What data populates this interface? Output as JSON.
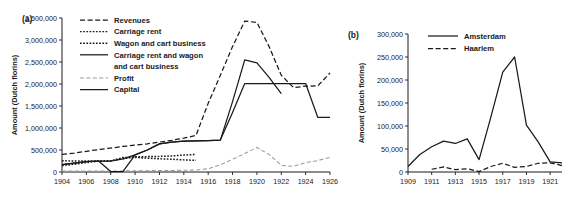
{
  "figure": {
    "background": "#ffffff",
    "ink_color": "#1a1a1a",
    "profit_color": "#9a9a9a"
  },
  "chart_data": [
    {
      "type": "line",
      "panel_tag": "(a)",
      "title": "",
      "xlabel": "",
      "ylabel": "Amount (Dutch florins)",
      "xlim": [
        1904,
        1926
      ],
      "ylim": [
        0,
        3500000
      ],
      "grid": false,
      "legend_position": "top-left-inside",
      "xticks": [
        1904,
        1906,
        1908,
        1910,
        1912,
        1914,
        1916,
        1918,
        1920,
        1922,
        1924,
        1926
      ],
      "xtick_labels": [
        "1904",
        "1906",
        "1908",
        "1910",
        "1912",
        "1914",
        "1916",
        "1918",
        "1920",
        "1922",
        "1924",
        "1926"
      ],
      "yticks": [
        0,
        500000,
        1000000,
        1500000,
        2000000,
        2500000,
        3000000,
        3500000
      ],
      "ytick_labels": [
        "0",
        "500,000",
        "1,000,000",
        "1,500,000",
        "2,000,000",
        "2,500,000",
        "3,000,000",
        "3,500,000"
      ],
      "series": [
        {
          "name": "Revenues",
          "style": "dashed",
          "color": "#1a1a1a",
          "x": [
            1904,
            1905,
            1906,
            1907,
            1908,
            1909,
            1910,
            1911,
            1912,
            1913,
            1914,
            1915,
            1916,
            1917,
            1918,
            1919,
            1920,
            1921,
            1922,
            1923,
            1924,
            1925,
            1926
          ],
          "values": [
            400000,
            430000,
            470000,
            510000,
            545000,
            580000,
            610000,
            640000,
            680000,
            720000,
            770000,
            830000,
            1560000,
            2200000,
            2850000,
            3430000,
            3400000,
            2850000,
            2200000,
            1920000,
            1950000,
            1960000,
            2250000
          ]
        },
        {
          "name": "Carriage rent",
          "style": "dotted",
          "color": "#1a1a1a",
          "x": [
            1904,
            1905,
            1906,
            1907,
            1908,
            1909,
            1910,
            1911,
            1912,
            1913,
            1914,
            1915
          ],
          "values": [
            255000,
            250000,
            250000,
            250000,
            255000,
            300000,
            345000,
            350000,
            355000,
            365000,
            385000,
            400000
          ]
        },
        {
          "name": "Wagon and cart business",
          "style": "dotted",
          "color": "#1a1a1a",
          "x": [
            1904,
            1905,
            1906,
            1907,
            1908,
            1909,
            1910,
            1911,
            1912,
            1913,
            1914,
            1915
          ],
          "values": [
            145000,
            175000,
            215000,
            245000,
            250000,
            330000,
            330000,
            315000,
            300000,
            290000,
            275000,
            265000
          ]
        },
        {
          "name": "Carriage rent and wagon and cart business",
          "style": "solid",
          "color": "#1a1a1a",
          "x": [
            1904,
            1905,
            1906,
            1907,
            1908,
            1909,
            1910,
            1911,
            1912,
            1913,
            1914,
            1915,
            1916,
            1917,
            1918,
            1919,
            1920,
            1921,
            1922
          ],
          "values": [
            165000,
            200000,
            235000,
            250000,
            248000,
            300000,
            390000,
            500000,
            640000,
            680000,
            700000,
            710000,
            715000,
            725000,
            1600000,
            2550000,
            2480000,
            2150000,
            1780000
          ]
        },
        {
          "name": "Profit",
          "style": "dashed-light",
          "color": "#9a9a9a",
          "x": [
            1904,
            1905,
            1906,
            1907,
            1908,
            1909,
            1910,
            1911,
            1912,
            1913,
            1914,
            1915,
            1916,
            1917,
            1918,
            1919,
            1920,
            1921,
            1922,
            1923,
            1924,
            1925,
            1926
          ],
          "values": [
            20000,
            20000,
            20000,
            25000,
            20000,
            25000,
            30000,
            30000,
            35000,
            35000,
            40000,
            45000,
            75000,
            160000,
            290000,
            420000,
            555000,
            400000,
            150000,
            130000,
            210000,
            260000,
            335000
          ]
        },
        {
          "name": "Capital",
          "style": "solid",
          "color": "#1a1a1a",
          "x": [
            1904,
            1905,
            1906,
            1907,
            1908,
            1909,
            1910,
            1911,
            1912,
            1913,
            1914,
            1915,
            1916,
            1917,
            1918,
            1919,
            1920,
            1921,
            1922,
            1923,
            1924,
            1925,
            1926
          ],
          "values": [
            165000,
            200000,
            235000,
            250000,
            10000,
            10000,
            390000,
            500000,
            640000,
            680000,
            700000,
            710000,
            715000,
            725000,
            1350000,
            2010000,
            2010000,
            2010000,
            2010000,
            2010000,
            2010000,
            1240000,
            1240000
          ]
        }
      ]
    },
    {
      "type": "line",
      "panel_tag": "(b)",
      "title": "",
      "xlabel": "",
      "ylabel": "Amount (Dutch florins)",
      "xlim": [
        1909,
        1922
      ],
      "ylim": [
        0,
        300000
      ],
      "grid": false,
      "legend_position": "top-left-inside",
      "xticks": [
        1909,
        1911,
        1913,
        1915,
        1917,
        1919,
        1921
      ],
      "xtick_labels": [
        "1909",
        "1911",
        "1913",
        "1915",
        "1917",
        "1919",
        "1921"
      ],
      "yticks": [
        0,
        50000,
        100000,
        150000,
        200000,
        250000,
        300000
      ],
      "ytick_labels": [
        "0",
        "50,000",
        "100,000",
        "150,000",
        "200,000",
        "250,000",
        "300,000"
      ],
      "series": [
        {
          "name": "Amsterdam",
          "style": "solid",
          "color": "#1a1a1a",
          "x": [
            1909,
            1910,
            1911,
            1912,
            1913,
            1914,
            1915,
            1916,
            1917,
            1918,
            1919,
            1920,
            1921,
            1922
          ],
          "values": [
            12000,
            38000,
            55000,
            67000,
            62000,
            72000,
            27000,
            120000,
            217000,
            250000,
            102000,
            65000,
            22000,
            20000
          ]
        },
        {
          "name": "Haarlem",
          "style": "dashed",
          "color": "#1a1a1a",
          "x": [
            1911,
            1912,
            1913,
            1914,
            1915,
            1916,
            1917,
            1918,
            1919,
            1920,
            1921,
            1922
          ],
          "values": [
            6000,
            11000,
            5000,
            7000,
            1000,
            12000,
            19000,
            10000,
            12000,
            19000,
            20000,
            14000
          ]
        }
      ]
    }
  ],
  "panel_a": {
    "tag": "(a)",
    "ylabel": "Amount (Dutch florins)",
    "legend": [
      {
        "label": "Revenues",
        "style": "dashed"
      },
      {
        "label": "Carriage rent",
        "style": "dotted"
      },
      {
        "label": "Wagon and cart business",
        "style": "dotted"
      },
      {
        "label": "Carriage rent and wagon",
        "style": "solid"
      },
      {
        "label": "and cart business",
        "style": "none"
      },
      {
        "label": "Profit",
        "style": "dashed-light"
      },
      {
        "label": "Capital",
        "style": "solid"
      }
    ]
  },
  "panel_b": {
    "tag": "(b)",
    "ylabel": "Amount (Dutch florins)",
    "legend": [
      {
        "label": "Amsterdam",
        "style": "solid"
      },
      {
        "label": "Haarlem",
        "style": "dashed"
      }
    ]
  }
}
